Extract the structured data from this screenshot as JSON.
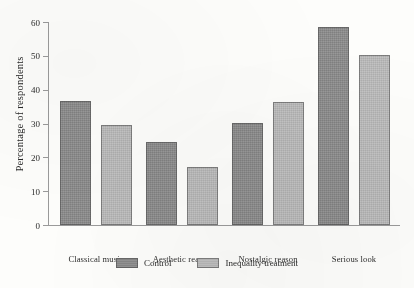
{
  "chart_data": {
    "type": "bar",
    "title": "",
    "xlabel": "",
    "ylabel": "Percentage of respondents",
    "ylim": [
      0,
      60
    ],
    "yticks": [
      0,
      10,
      20,
      30,
      40,
      50,
      60
    ],
    "ytick_labels": [
      "0",
      "10",
      "20",
      "30",
      "40",
      "50",
      "60"
    ],
    "grid": false,
    "legend_position": "bottom-center",
    "categories": [
      "Classical music",
      "Aesthetic reason",
      "Nostalgic reason",
      "Serious look"
    ],
    "series": [
      {
        "name": "Control",
        "color": "#8d8d8d",
        "values": [
          36.8,
          24.5,
          30.3,
          58.5
        ]
      },
      {
        "name": "Inequality treatment",
        "color": "#bcbcbc",
        "values": [
          29.5,
          17.2,
          36.5,
          50.2
        ]
      }
    ]
  },
  "legend": {
    "items": [
      {
        "label": "Control"
      },
      {
        "label": "Inequality treatment"
      }
    ]
  },
  "colors": {
    "background": "#fdfdfb",
    "axis": "#9a9a9a",
    "text": "#2b2b2b",
    "control": "#8d8d8d",
    "treatment": "#bcbcbc"
  }
}
